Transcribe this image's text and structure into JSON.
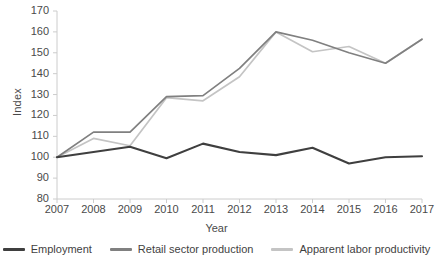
{
  "chart_data": {
    "type": "line",
    "title": "",
    "xlabel": "Year",
    "ylabel": "Index",
    "x": [
      2007,
      2008,
      2009,
      2010,
      2011,
      2012,
      2013,
      2014,
      2015,
      2016,
      2017
    ],
    "xtick_labels": [
      "2007",
      "2008",
      "2009",
      "2010",
      "2011",
      "2012",
      "2013",
      "2014",
      "2015",
      "2016",
      "2017"
    ],
    "ytick_labels": [
      "80",
      "90",
      "100",
      "110",
      "120",
      "130",
      "140",
      "150",
      "160",
      "170"
    ],
    "yticks": [
      80,
      90,
      100,
      110,
      120,
      130,
      140,
      150,
      160,
      170
    ],
    "ylim": [
      80,
      170
    ],
    "xlim": [
      2007,
      2017
    ],
    "grid": false,
    "legend_position": "bottom",
    "series": [
      {
        "name": "Employment",
        "color": "#3f3f3f",
        "values": [
          100,
          102.5,
          105,
          99.5,
          106.5,
          102.5,
          101,
          104.5,
          97,
          100,
          100.5
        ]
      },
      {
        "name": "Retail sector production",
        "color": "#808080",
        "values": [
          100,
          112,
          112,
          129,
          129.5,
          142.5,
          160,
          156,
          150,
          145,
          156.5
        ]
      },
      {
        "name": "Apparent labor productivity",
        "color": "#c4c4c4",
        "values": [
          100,
          109,
          105.5,
          128.5,
          127,
          138.5,
          160,
          150.5,
          153,
          145,
          156.5
        ]
      }
    ]
  },
  "axis": {
    "ylabel": "Index",
    "xlabel": "Year"
  }
}
